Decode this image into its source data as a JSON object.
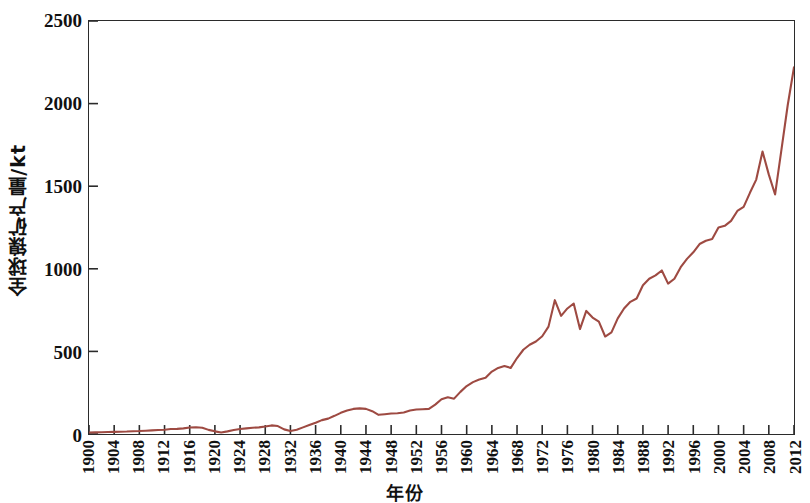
{
  "chart_data": {
    "type": "line",
    "title": "",
    "xlabel": "年份",
    "ylabel": "全球镍矿产量/kt",
    "xlim": [
      1900,
      2012
    ],
    "ylim": [
      0,
      2500
    ],
    "grid": false,
    "legend": null,
    "line_color": "#9e4a42",
    "axis_color": "#2b2b2b",
    "y_ticks": [
      0,
      500,
      1000,
      1500,
      2000,
      2500
    ],
    "y_tick_labels": [
      "0",
      "500",
      "1000",
      "1500",
      "2000",
      "2500"
    ],
    "x_ticks": [
      1900,
      1904,
      1908,
      1912,
      1916,
      1920,
      1924,
      1928,
      1932,
      1936,
      1940,
      1944,
      1948,
      1952,
      1956,
      1960,
      1964,
      1968,
      1972,
      1976,
      1980,
      1984,
      1988,
      1992,
      1996,
      2000,
      2004,
      2008,
      2012
    ],
    "x_tick_labels": [
      "1900",
      "1904",
      "1908",
      "1912",
      "1916",
      "1920",
      "1924",
      "1928",
      "1932",
      "1936",
      "1940",
      "1944",
      "1948",
      "1952",
      "1956",
      "1960",
      "1964",
      "1968",
      "1972",
      "1976",
      "1980",
      "1984",
      "1988",
      "1992",
      "1996",
      "2000",
      "2004",
      "2008",
      "2012"
    ],
    "series": [
      {
        "name": "全球镍矿产量",
        "x": [
          1900,
          1901,
          1902,
          1903,
          1904,
          1905,
          1906,
          1907,
          1908,
          1909,
          1910,
          1911,
          1912,
          1913,
          1914,
          1915,
          1916,
          1917,
          1918,
          1919,
          1920,
          1921,
          1922,
          1923,
          1924,
          1925,
          1926,
          1927,
          1928,
          1929,
          1930,
          1931,
          1932,
          1933,
          1934,
          1935,
          1936,
          1937,
          1938,
          1939,
          1940,
          1941,
          1942,
          1943,
          1944,
          1945,
          1946,
          1947,
          1948,
          1949,
          1950,
          1951,
          1952,
          1953,
          1954,
          1955,
          1956,
          1957,
          1958,
          1959,
          1960,
          1961,
          1962,
          1963,
          1964,
          1965,
          1966,
          1967,
          1968,
          1969,
          1970,
          1971,
          1972,
          1973,
          1974,
          1975,
          1976,
          1977,
          1978,
          1979,
          1980,
          1981,
          1982,
          1983,
          1984,
          1985,
          1986,
          1987,
          1988,
          1989,
          1990,
          1991,
          1992,
          1993,
          1994,
          1995,
          1996,
          1997,
          1998,
          1999,
          2000,
          2001,
          2002,
          2003,
          2004,
          2005,
          2006,
          2007,
          2008,
          2009,
          2010,
          2011,
          2012
        ],
        "values": [
          9,
          10,
          11,
          12,
          13,
          14,
          15,
          17,
          18,
          20,
          22,
          24,
          26,
          30,
          31,
          34,
          39,
          41,
          38,
          25,
          16,
          9,
          16,
          24,
          30,
          34,
          38,
          40,
          45,
          52,
          48,
          28,
          18,
          26,
          40,
          54,
          68,
          84,
          93,
          110,
          128,
          142,
          152,
          155,
          152,
          138,
          116,
          120,
          124,
          126,
          130,
          142,
          148,
          150,
          152,
          178,
          210,
          222,
          214,
          255,
          290,
          314,
          330,
          340,
          378,
          400,
          412,
          400,
          460,
          510,
          540,
          560,
          592,
          650,
          810,
          715,
          760,
          790,
          635,
          745,
          705,
          680,
          590,
          615,
          700,
          760,
          800,
          820,
          900,
          940,
          960,
          990,
          910,
          940,
          1010,
          1060,
          1100,
          1150,
          1170,
          1180,
          1250,
          1260,
          1290,
          1350,
          1375,
          1460,
          1540,
          1710,
          1570,
          1450,
          1720,
          1990,
          2220
        ]
      }
    ]
  }
}
